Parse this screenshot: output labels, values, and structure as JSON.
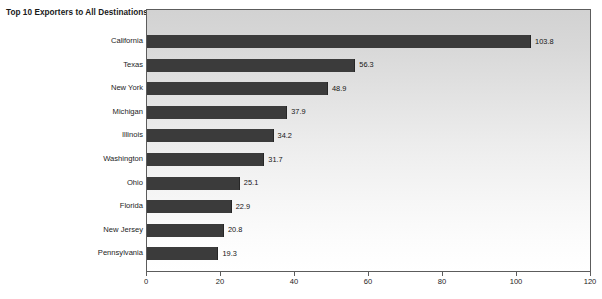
{
  "chart_data": {
    "type": "bar",
    "orientation": "horizontal",
    "title": "Top 10 Exporters to All Destinations",
    "xlabel": "",
    "ylabel": "",
    "categories": [
      "California",
      "Texas",
      "New York",
      "Michigan",
      "Illinois",
      "Washington",
      "Ohio",
      "Florida",
      "New Jersey",
      "Pennsylvania"
    ],
    "values": [
      103.8,
      56.3,
      48.9,
      37.9,
      34.2,
      31.7,
      25.1,
      22.9,
      20.8,
      19.3
    ],
    "value_labels": [
      "103.8",
      "56.3",
      "48.9",
      "37.9",
      "34.2",
      "31.7",
      "25.1",
      "22.9",
      "20.8",
      "19.3"
    ],
    "xlim": [
      0,
      120
    ],
    "xticks": [
      0,
      20,
      40,
      60,
      80,
      100,
      120
    ],
    "xtick_labels": [
      "0",
      "20",
      "40",
      "60",
      "80",
      "100",
      "120"
    ],
    "grid": false,
    "legend": null,
    "bar_color": "#3b3b3b",
    "plot_background_top": "#d2d2d2",
    "plot_background_bottom": "#ffffff",
    "axis_color": "#5c5c5c",
    "text_color": "#1c1c1c"
  }
}
